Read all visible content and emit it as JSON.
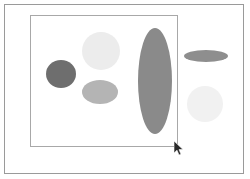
{
  "figure": {
    "title": "",
    "background_color": "#ffffff",
    "outer_frame": {
      "name": "outer-document-border",
      "border_color": "#9a9a9a",
      "x": 4,
      "y": 4,
      "width": 240,
      "height": 170
    },
    "inner_frame": {
      "name": "inner-plot-border",
      "border_color": "#a8a8a8",
      "x": 30,
      "y": 15,
      "width": 148,
      "height": 132
    }
  },
  "chart_data": {
    "type": "scatter",
    "title": "",
    "subtitle": "",
    "xlabel": "",
    "ylabel": "",
    "grid": false,
    "legend": "none",
    "xlim": [
      0,
      250
    ],
    "ylim": [
      0,
      179
    ],
    "series": [
      {
        "name": "ellipses",
        "points": [
          {
            "label": "dark-circle-left",
            "cx": 61,
            "cy": 74,
            "rx": 15,
            "ry": 14,
            "fill": "#6e6e6e",
            "shade": "dark gray",
            "shape": "circle",
            "inside_frame": true
          },
          {
            "label": "pale-circle-upper",
            "cx": 101,
            "cy": 51,
            "rx": 19,
            "ry": 19,
            "fill": "#ececec",
            "shade": "very light gray",
            "shape": "circle",
            "inside_frame": true
          },
          {
            "label": "mid-ellipse-lower",
            "cx": 100,
            "cy": 92,
            "rx": 18,
            "ry": 12,
            "fill": "#b4b4b4",
            "shade": "medium light gray",
            "shape": "ellipse-horizontal",
            "inside_frame": true
          },
          {
            "label": "tall-ellipse-center",
            "cx": 155,
            "cy": 81,
            "rx": 17,
            "ry": 53,
            "fill": "#8a8a8a",
            "shade": "medium gray",
            "shape": "ellipse-vertical",
            "inside_frame": true
          },
          {
            "label": "flat-ellipse-right",
            "cx": 206,
            "cy": 56,
            "rx": 22,
            "ry": 6,
            "fill": "#8e8e8e",
            "shade": "medium gray",
            "shape": "ellipse-horizontal-flat",
            "inside_frame": false
          },
          {
            "label": "pale-circle-right",
            "cx": 205,
            "cy": 104,
            "rx": 18,
            "ry": 18,
            "fill": "#f1f1f1",
            "shade": "near white gray",
            "shape": "circle",
            "inside_frame": false
          }
        ]
      }
    ]
  },
  "cursor": {
    "name": "mouse-pointer",
    "x": 174,
    "y": 141,
    "color": "#2a2a2a"
  }
}
